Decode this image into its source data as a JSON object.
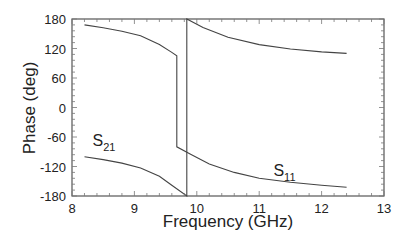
{
  "chart_data": {
    "type": "line",
    "title": "",
    "xlabel": "Frequency (GHz)",
    "ylabel": "Phase (deg)",
    "xlim": [
      8,
      13
    ],
    "ylim": [
      -180,
      180
    ],
    "xticks": [
      8,
      9,
      10,
      11,
      12,
      13
    ],
    "yticks": [
      180,
      120,
      60,
      0,
      -60,
      -120,
      -180
    ],
    "grid": false,
    "legend": "inline labels",
    "annotations": [
      {
        "text": "S",
        "sub": "21",
        "x": 8.2,
        "y": -78
      },
      {
        "text": "S",
        "sub": "11",
        "x": 11.1,
        "y": -140
      }
    ],
    "series": [
      {
        "name": "S11",
        "points": [
          [
            8.2,
            168
          ],
          [
            8.5,
            162
          ],
          [
            8.8,
            155
          ],
          [
            9.1,
            146
          ],
          [
            9.4,
            128
          ],
          [
            9.6,
            112
          ],
          [
            9.68,
            105
          ],
          [
            9.68,
            -80
          ],
          [
            9.9,
            -95
          ],
          [
            10.2,
            -115
          ],
          [
            10.6,
            -132
          ],
          [
            11.0,
            -144
          ],
          [
            11.5,
            -152
          ],
          [
            12.0,
            -158
          ],
          [
            12.4,
            -162
          ]
        ]
      },
      {
        "name": "S21",
        "points": [
          [
            8.2,
            -100
          ],
          [
            8.5,
            -106
          ],
          [
            8.8,
            -113
          ],
          [
            9.1,
            -123
          ],
          [
            9.4,
            -140
          ],
          [
            9.6,
            -158
          ],
          [
            9.84,
            -180
          ],
          [
            9.84,
            180
          ],
          [
            10.1,
            163
          ],
          [
            10.5,
            143
          ],
          [
            11.0,
            128
          ],
          [
            11.5,
            119
          ],
          [
            12.0,
            113
          ],
          [
            12.4,
            110
          ]
        ]
      }
    ]
  }
}
